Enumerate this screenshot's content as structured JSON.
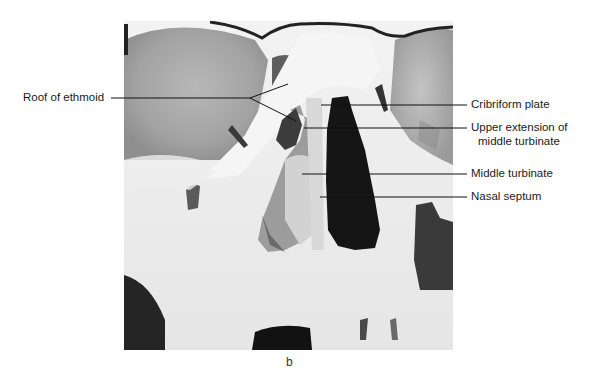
{
  "figure": {
    "panel_letter": "b",
    "labels": {
      "roof_of_ethmoid": "Roof of ethmoid",
      "cribriform_plate": "Cribriform plate",
      "upper_extension_line1": "Upper extension of",
      "upper_extension_line2": "middle turbinate",
      "middle_turbinate": "Middle turbinate",
      "nasal_septum": "Nasal septum"
    }
  }
}
